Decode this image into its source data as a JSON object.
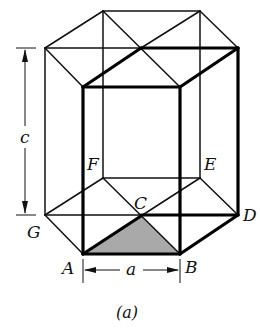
{
  "figure": {
    "caption": "(a)",
    "shade_color": "#a9a9a9",
    "line_color": "#111111"
  },
  "labels": {
    "A": "A",
    "B": "B",
    "C": "C",
    "D": "D",
    "E": "E",
    "F": "F",
    "G": "G",
    "a": "a",
    "c": "c"
  },
  "dimensions": {
    "lattice_a": "a",
    "lattice_c": "c"
  }
}
